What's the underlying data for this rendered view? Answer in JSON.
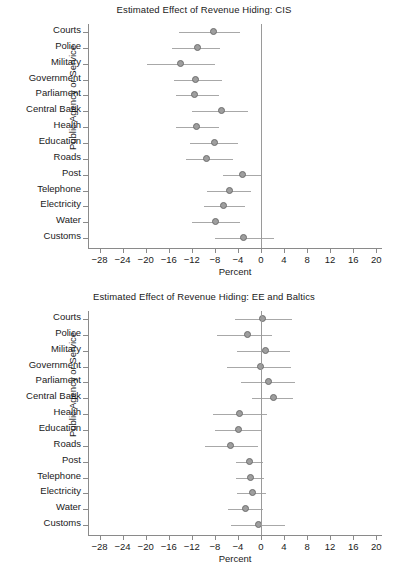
{
  "figure": {
    "width": 408,
    "height": 573,
    "background": "#ffffff",
    "marker_color": "#9e9e9e",
    "marker_edge_color": "#6e6e6e",
    "whisker_color": "#a8a8a8",
    "axis_color": "#8a8a8a"
  },
  "chart_data": [
    {
      "type": "scatter",
      "title": "Estimated Effect of Revenue Hiding: CIS",
      "xlabel": "Percent",
      "ylabel": "Public Agency or Service",
      "xlim": [
        -30,
        21
      ],
      "xticks": [
        -28,
        -24,
        -20,
        -16,
        -12,
        -8,
        -4,
        0,
        4,
        8,
        12,
        16,
        20
      ],
      "xticklabels": [
        "-28",
        "-24",
        "-20",
        "-16",
        "-12",
        "-8",
        "-4",
        "0",
        "4",
        "8",
        "12",
        "16",
        "20"
      ],
      "grid": false,
      "legend": null,
      "reference_line": 0,
      "orientation": "horizontal",
      "categories": [
        "Courts",
        "Police",
        "Military",
        "Government",
        "Parliament",
        "Central Bank",
        "Health",
        "Education",
        "Roads",
        "Post",
        "Telephone",
        "Electricity",
        "Water",
        "Customs"
      ],
      "values": [
        -8.3,
        -11.0,
        -13.9,
        -11.3,
        -11.5,
        -6.8,
        -11.2,
        -8.0,
        -9.4,
        -3.2,
        -5.5,
        -6.5,
        -7.8,
        -3.1
      ],
      "ci_low": [
        -14.2,
        -15.5,
        -19.7,
        -15.0,
        -14.8,
        -12.0,
        -14.7,
        -12.3,
        -13.0,
        -6.6,
        -9.3,
        -9.8,
        -12.0,
        -8.0
      ],
      "ci_high": [
        -3.7,
        -7.1,
        -8.0,
        -6.7,
        -7.3,
        -2.3,
        -7.2,
        -4.0,
        -4.9,
        0.2,
        -1.8,
        -2.8,
        -3.6,
        2.2
      ]
    },
    {
      "type": "scatter",
      "title": "Estimated Effect of Revenue Hiding: EE and Baltics",
      "xlabel": "Percent",
      "ylabel": "Public Agency or Service",
      "xlim": [
        -30,
        21
      ],
      "xticks": [
        -28,
        -24,
        -20,
        -16,
        -12,
        -8,
        -4,
        0,
        4,
        8,
        12,
        16,
        20
      ],
      "xticklabels": [
        "-28",
        "-24",
        "-20",
        "-16",
        "-12",
        "-8",
        "-4",
        "0",
        "4",
        "8",
        "12",
        "16",
        "20"
      ],
      "grid": false,
      "legend": null,
      "reference_line": 0,
      "orientation": "horizontal",
      "categories": [
        "Courts",
        "Police",
        "Military",
        "Government",
        "Parliament",
        "Central Bank",
        "Health",
        "Education",
        "Roads",
        "Post",
        "Telephone",
        "Electricity",
        "Water",
        "Customs"
      ],
      "values": [
        0.2,
        -2.4,
        0.8,
        -0.1,
        1.3,
        2.2,
        -3.8,
        -3.9,
        -5.3,
        -1.9,
        -1.8,
        -1.4,
        -2.6,
        -0.4
      ],
      "ci_low": [
        -4.5,
        -7.7,
        -4.1,
        -5.9,
        -3.4,
        -1.6,
        -8.3,
        -7.9,
        -9.7,
        -4.4,
        -4.3,
        -4.1,
        -5.8,
        -5.2
      ],
      "ci_high": [
        5.4,
        2.0,
        5.1,
        5.3,
        5.9,
        5.5,
        1.1,
        0.1,
        -0.5,
        0.4,
        0.5,
        0.9,
        0.4,
        4.1
      ]
    }
  ]
}
